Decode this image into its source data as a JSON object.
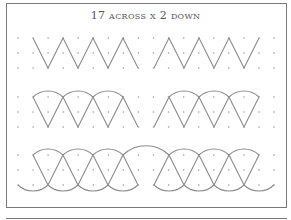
{
  "title": "17 across x 2 down",
  "colors": {
    "line": "#8c8c8c",
    "dot": "#9a9a9a",
    "frame": "#7a7a7a",
    "background": "#ffffff"
  },
  "grid": {
    "columns": 18,
    "x0": 18,
    "dx": 15.06,
    "row_groups": [
      [
        38,
        53,
        68
      ],
      [
        97,
        112,
        127
      ],
      [
        155,
        170,
        185
      ]
    ]
  },
  "patterns": [
    {
      "name": "zigzag",
      "segments": [
        [
          [
            33,
            38
          ],
          [
            48,
            68
          ],
          [
            63,
            38
          ],
          [
            78,
            68
          ],
          [
            93,
            38
          ],
          [
            108,
            68
          ],
          [
            123,
            38
          ],
          [
            138,
            68
          ]
        ],
        [
          [
            154,
            68
          ],
          [
            169,
            38
          ],
          [
            184,
            68
          ],
          [
            199,
            38
          ],
          [
            214,
            68
          ],
          [
            229,
            38
          ],
          [
            244,
            68
          ],
          [
            259,
            38
          ]
        ]
      ],
      "arcs": []
    },
    {
      "name": "zigzag-with-top-arcs",
      "segments": [
        [
          [
            33,
            97
          ],
          [
            48,
            127
          ],
          [
            63,
            97
          ],
          [
            78,
            127
          ],
          [
            93,
            97
          ],
          [
            108,
            127
          ],
          [
            123,
            97
          ],
          [
            138,
            127
          ]
        ],
        [
          [
            154,
            127
          ],
          [
            169,
            97
          ],
          [
            184,
            127
          ],
          [
            199,
            97
          ],
          [
            214,
            127
          ],
          [
            229,
            97
          ],
          [
            244,
            127
          ],
          [
            259,
            97
          ]
        ]
      ],
      "arcs": [
        [
          33,
          97,
          63,
          97,
          -1
        ],
        [
          63,
          97,
          93,
          97,
          -1
        ],
        [
          93,
          97,
          123,
          97,
          -1
        ],
        [
          169,
          97,
          199,
          97,
          -1
        ],
        [
          199,
          97,
          229,
          97,
          -1
        ],
        [
          229,
          97,
          259,
          97,
          -1
        ]
      ]
    },
    {
      "name": "zigzag-with-top-and-bottom-arcs",
      "segments": [
        [
          [
            33,
            155
          ],
          [
            48,
            185
          ],
          [
            63,
            155
          ],
          [
            78,
            185
          ],
          [
            93,
            155
          ],
          [
            108,
            185
          ],
          [
            123,
            155
          ],
          [
            138,
            185
          ]
        ],
        [
          [
            154,
            185
          ],
          [
            169,
            155
          ],
          [
            184,
            185
          ],
          [
            199,
            155
          ],
          [
            214,
            185
          ],
          [
            229,
            155
          ],
          [
            244,
            185
          ],
          [
            259,
            155
          ]
        ]
      ],
      "arcs": [
        [
          33,
          155,
          63,
          155,
          -1
        ],
        [
          63,
          155,
          93,
          155,
          -1
        ],
        [
          93,
          155,
          123,
          155,
          -1
        ],
        [
          123,
          155,
          169,
          155,
          -1
        ],
        [
          169,
          155,
          199,
          155,
          -1
        ],
        [
          199,
          155,
          229,
          155,
          -1
        ],
        [
          229,
          155,
          259,
          155,
          -1
        ],
        [
          18,
          185,
          48,
          185,
          1
        ],
        [
          48,
          185,
          78,
          185,
          1
        ],
        [
          78,
          185,
          108,
          185,
          1
        ],
        [
          108,
          185,
          138,
          185,
          1
        ],
        [
          154,
          185,
          184,
          185,
          1
        ],
        [
          184,
          185,
          214,
          185,
          1
        ],
        [
          214,
          185,
          244,
          185,
          1
        ],
        [
          244,
          185,
          274,
          185,
          1
        ]
      ]
    }
  ]
}
